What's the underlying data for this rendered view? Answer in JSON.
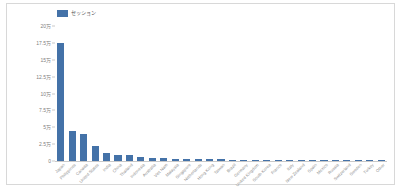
{
  "chart_data": {
    "type": "bar",
    "title": "",
    "subtitle": "",
    "xlabel": "",
    "ylabel": "",
    "legend": [
      {
        "name": "セッション",
        "color": "#4472a8"
      }
    ],
    "legend_position": "top-left",
    "grid": false,
    "ylim": [
      0,
      200000
    ],
    "y_ticks": [
      0,
      25000,
      50000,
      75000,
      100000,
      125000,
      150000,
      175000,
      200000
    ],
    "y_tick_labels": [
      "0",
      "2.5万",
      "5万",
      "7.5万",
      "10万",
      "12.5万",
      "15万",
      "17.5万",
      "20万"
    ],
    "categories": [
      "Japan",
      "Philippines",
      "Canada",
      "United States",
      "India",
      "China",
      "Thailand",
      "Indonesia",
      "Australia",
      "Viet Nam",
      "Malaysia",
      "Singapore",
      "Netherlands",
      "Hong Kong",
      "Taiwan",
      "Brazil",
      "Germany",
      "United Kingdom",
      "South Korea",
      "France",
      "Italy",
      "New Zealand",
      "Spain",
      "Mexico",
      "Russia",
      "Switzerland",
      "Sweden",
      "Turkey",
      "Other"
    ],
    "values": [
      175000,
      45000,
      40000,
      22000,
      12000,
      9500,
      8500,
      5500,
      5000,
      4200,
      3500,
      3200,
      2800,
      2500,
      2300,
      2000,
      1900,
      1800,
      1700,
      1600,
      1500,
      1400,
      1300,
      1200,
      1100,
      1000,
      900,
      800,
      700
    ],
    "series": [
      {
        "name": "セッション",
        "color": "#4472a8",
        "values": [
          175000,
          45000,
          40000,
          22000,
          12000,
          9500,
          8500,
          5500,
          5000,
          4200,
          3500,
          3200,
          2800,
          2500,
          2300,
          2000,
          1900,
          1800,
          1700,
          1600,
          1500,
          1400,
          1300,
          1200,
          1100,
          1000,
          900,
          800,
          700
        ]
      }
    ]
  },
  "style": {
    "bar_color": "#4472a8",
    "frame_color": "#d8d8d8",
    "axis_color": "#c9c9c9",
    "tick_text_color": "#808080",
    "xlabel_text_color": "#8a8a8a",
    "background": "#ffffff"
  }
}
